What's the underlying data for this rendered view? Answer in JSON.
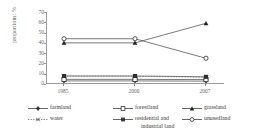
{
  "chart_data": {
    "type": "line",
    "title": "",
    "subtitle": "",
    "xlabel": "",
    "ylabel": "proportions: %",
    "categories": [
      "1985",
      "2000",
      "2007"
    ],
    "x": [
      "1985",
      "2000",
      "2007"
    ],
    "ylim": [
      0,
      70
    ],
    "yticks": [
      0,
      10,
      20,
      30,
      40,
      50,
      60,
      70
    ],
    "grid": false,
    "legend_position": "bottom",
    "series": [
      {
        "name": "farmland",
        "marker": "filled-diamond",
        "values": [
          3.0,
          3.0,
          2.8
        ]
      },
      {
        "name": "forestland",
        "marker": "open-square",
        "values": [
          4.5,
          4.5,
          4.3
        ]
      },
      {
        "name": "grassland",
        "marker": "filled-triangle",
        "values": [
          40.0,
          40.0,
          59.0
        ]
      },
      {
        "name": "water",
        "marker": "cross",
        "values": [
          7.5,
          7.5,
          6.5
        ]
      },
      {
        "name": "residential and industrial land",
        "marker": "filled-square",
        "values": [
          7.8,
          7.8,
          7.0
        ]
      },
      {
        "name": "unusedland",
        "marker": "open-circle",
        "values": [
          44.0,
          44.0,
          25.0
        ]
      }
    ]
  },
  "legend": {
    "entries": [
      {
        "label": "farmland"
      },
      {
        "label": "forestland"
      },
      {
        "label": "grassland"
      },
      {
        "label": "water"
      },
      {
        "label_line1": "residential and",
        "label_line2": "industrial land"
      },
      {
        "label": "unusedland"
      }
    ]
  },
  "axis": {
    "yticks": [
      "70",
      "60",
      "50",
      "40",
      "30",
      "20",
      "10",
      "0"
    ],
    "xticks": [
      "1985",
      "2000",
      "2007"
    ],
    "ylabel": "proportions: %"
  },
  "colors": {
    "line": "#555555",
    "axis": "#9a9a9a",
    "text": "#3a3a3a"
  }
}
